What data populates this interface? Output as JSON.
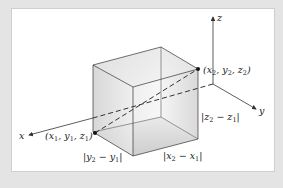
{
  "figure": {
    "axes": {
      "x_label": "x",
      "y_label": "y",
      "z_label": "z"
    },
    "points": [
      {
        "label": "(x1, y1, z1)",
        "display": [
          "(x",
          "1",
          ", y",
          "1",
          ", z",
          "1",
          ")"
        ]
      },
      {
        "label": "(x2, y2, z2)",
        "display": [
          "(x",
          "2",
          ", y",
          "2",
          ", z",
          "2",
          ")"
        ]
      }
    ],
    "edge_labels": {
      "dz": {
        "text": "|z2 − z1|",
        "a": "|z",
        "a_sub": "2",
        "mid": " − z",
        "b_sub": "1",
        "end": "|"
      },
      "dy": {
        "text": "|y2 − y1|",
        "a": "|y",
        "a_sub": "2",
        "mid": " − y",
        "b_sub": "1",
        "end": "|"
      },
      "dx": {
        "text": "|x2 − x1|",
        "a": "|x",
        "a_sub": "2",
        "mid": " − x",
        "b_sub": "1",
        "end": "|"
      }
    },
    "colors": {
      "background": "#e4e4e4",
      "panel": "#ffffff",
      "stroke": "#333333",
      "box_fill_light": "#f2f2f2",
      "box_fill_dark": "#c8c8c8"
    }
  }
}
